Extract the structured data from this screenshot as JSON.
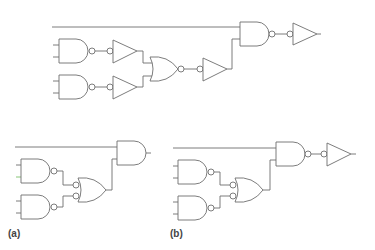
{
  "labels": {
    "a": "(a)",
    "b": "(b)"
  },
  "diagram": {
    "type": "logic-circuit",
    "circuits": [
      {
        "id": "top",
        "gates": [
          "NAND",
          "NAND",
          "inverter-buffer",
          "inverter-buffer",
          "NOR",
          "inverter-buffer",
          "NAND",
          "inverter-buffer"
        ]
      },
      {
        "id": "a",
        "gates": [
          "NAND",
          "NAND",
          "OR with inverted inputs",
          "AND"
        ]
      },
      {
        "id": "b",
        "gates": [
          "NAND",
          "NAND",
          "OR with inverted inputs",
          "NAND",
          "inverter-buffer"
        ]
      }
    ],
    "colors": {
      "wire": "#6e6e6e",
      "background": "#ffffff"
    }
  }
}
